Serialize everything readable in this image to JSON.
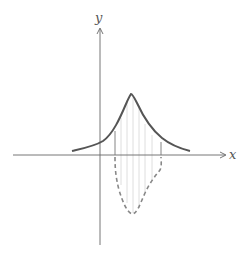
{
  "diagram": {
    "axes": {
      "x_label": "x",
      "y_label": "y"
    },
    "curves": [
      {
        "name": "bell-curve",
        "style": "solid",
        "color": "#555555",
        "description": "positive peaked curve above x-axis"
      },
      {
        "name": "transformed-curve",
        "style": "dashed",
        "color": "#8a8a8a",
        "description": "dashed curve below x-axis over interval"
      }
    ],
    "hatch_lines": {
      "count": 6,
      "color": "#d0d0d0"
    }
  }
}
